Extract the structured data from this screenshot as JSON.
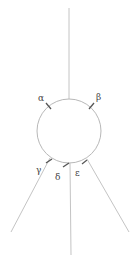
{
  "diagram": {
    "labels": {
      "alpha": "α",
      "beta": "β",
      "gamma": "γ",
      "delta": "δ",
      "epsilon": "ε"
    },
    "colors": {
      "line": "#c4c4c4",
      "circle": "#b8b8b8",
      "marker": "#555555",
      "label": "#444444"
    }
  }
}
